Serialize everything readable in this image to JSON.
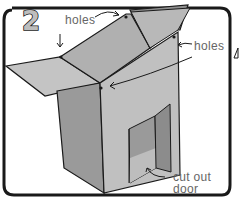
{
  "figure": {
    "step_number": "2",
    "labels": {
      "holes_top": "holes",
      "holes_right": "holes",
      "cutout_door_line1": "cut out",
      "cutout_door_line2": "door"
    },
    "colors": {
      "frame": "#1a1a1a",
      "background": "#ffffff",
      "panel_light": "#c8c8c8",
      "panel_mid": "#a8a8a8",
      "panel_dark": "#8c8c8c",
      "label_text": "#666666"
    }
  }
}
